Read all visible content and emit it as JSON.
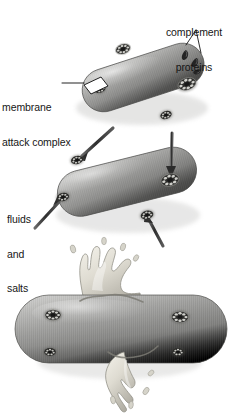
{
  "figure": {
    "background_color": "#ffffff",
    "width": 242,
    "height": 417,
    "style": "greyscale airbrush scientific illustration"
  },
  "labels": {
    "complement_proteins": {
      "name": "complement-proteins-label",
      "line1": "complement",
      "line2": "proteins",
      "leader": "two-pronged leader lines to dark wedge-shaped protein molecules"
    },
    "membrane_attack_complex": {
      "name": "membrane-attack-complex-label",
      "line1": "membrane",
      "line2": "attack complex",
      "leader": "horizontal rule to white parallelogram callout box over a pore"
    },
    "fluids_and_salts": {
      "name": "fluids-and-salts-label",
      "line1": "fluids",
      "line2": "and",
      "line3": "salts",
      "leader": "arrow pointing into a membrane pore"
    }
  },
  "colors": {
    "cell_body_light": "#c8c8c6",
    "cell_body_mid": "#9c9c9a",
    "cell_body_dark": "#6e6e6c",
    "cell_outline": "#4a4a48",
    "pore_dark": "#2b2b2b",
    "pore_ring": "#d8d8d6",
    "cytoplasm_light": "#e4e2da",
    "cytoplasm_mid": "#bdbbb2",
    "arrow_dark": "#3a3a3a",
    "text": "#161616",
    "background": "#ffffff"
  },
  "stages": [
    {
      "id": "stage-1",
      "name": "bacterium-stage-1-attack",
      "caption_implied": "Complement proteins assemble membrane attack complexes in the bacterial membrane",
      "rotation_deg": -18,
      "pore_count": 4,
      "has_free_proteins": true,
      "has_arrows": false,
      "is_lysing": false
    },
    {
      "id": "stage-2",
      "name": "bacterium-stage-2-influx",
      "caption_implied": "Fluids and salts flow into the cell through the open pores",
      "rotation_deg": -14,
      "pore_count": 4,
      "has_free_proteins": false,
      "has_arrows": true,
      "arrow_count": 4,
      "is_lysing": false
    },
    {
      "id": "stage-3",
      "name": "bacterium-stage-3-lysis",
      "caption_implied": "The swollen cell ruptures and cytoplasm bursts out",
      "rotation_deg": 0,
      "pore_count": 4,
      "has_free_proteins": false,
      "has_arrows": false,
      "is_lysing": true,
      "rupture_count": 2
    }
  ]
}
